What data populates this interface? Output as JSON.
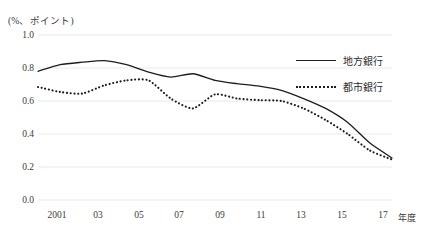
{
  "chart_data": {
    "type": "line",
    "title": "",
    "subtitle": "",
    "unit_label": "(%、ポイント)",
    "xlabel": "年度",
    "ylabel": "",
    "grid": true,
    "legend_position": "top-right",
    "ylim": [
      0.0,
      1.0
    ],
    "yticks": [
      "1.0",
      "0.8",
      "0.6",
      "0.4",
      "0.2",
      "0.0"
    ],
    "ytick_values": [
      1.0,
      0.8,
      0.6,
      0.4,
      0.2,
      0.0
    ],
    "xlim": [
      2001,
      2017
    ],
    "xticks": [
      "2001",
      "03",
      "05",
      "07",
      "09",
      "11",
      "13",
      "15",
      "17"
    ],
    "xtick_values": [
      2001,
      2003,
      2005,
      2007,
      2009,
      2011,
      2013,
      2015,
      2017
    ],
    "x": [
      2001,
      2002,
      2003,
      2004,
      2005,
      2006,
      2007,
      2008,
      2009,
      2010,
      2011,
      2012,
      2013,
      2014,
      2015,
      2016,
      2017
    ],
    "series": [
      {
        "name": "地方銀行",
        "style": "solid",
        "color": "#1d1d1d",
        "values": [
          0.78,
          0.82,
          0.835,
          0.845,
          0.82,
          0.775,
          0.745,
          0.765,
          0.725,
          0.705,
          0.69,
          0.665,
          0.615,
          0.555,
          0.47,
          0.345,
          0.255
        ]
      },
      {
        "name": "都市銀行",
        "style": "dotted",
        "color": "#1d1d1d",
        "values": [
          0.685,
          0.655,
          0.645,
          0.695,
          0.725,
          0.725,
          0.615,
          0.555,
          0.64,
          0.615,
          0.605,
          0.6,
          0.555,
          0.485,
          0.4,
          0.3,
          0.245
        ]
      }
    ]
  },
  "legend": {
    "items": [
      {
        "label": "地方銀行",
        "style": "solid"
      },
      {
        "label": "都市銀行",
        "style": "dotted"
      }
    ]
  }
}
